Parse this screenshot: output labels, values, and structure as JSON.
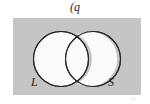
{
  "figure": {
    "caption": "(q",
    "panel_color": "#c5c5c5",
    "background_color": "#ffffff",
    "stroke_color": "#262626",
    "fill_color": "#fbfbfb",
    "footer_mark": "o"
  },
  "diagram": {
    "type": "venn",
    "sets": [
      {
        "id": "L",
        "label": "L",
        "cx": 61,
        "cy": 59,
        "r": 27.5
      },
      {
        "id": "S",
        "label": "S",
        "cx": 93,
        "cy": 59,
        "r": 27.5
      }
    ]
  }
}
